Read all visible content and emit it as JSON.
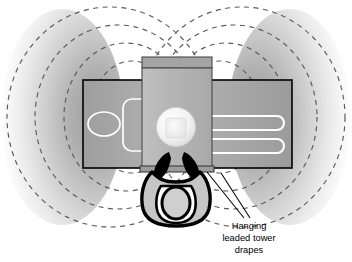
{
  "figure": {
    "type": "schematic-diagram",
    "view": "overhead",
    "background_color": "#ffffff"
  },
  "annotation": {
    "label_lines": [
      "Hanging",
      "leaded tower",
      "drapes"
    ],
    "full_text": "Hanging leaded tower drapes",
    "text_color": "#000000",
    "leader_line_color": "#000000",
    "leader_count": 2
  },
  "scatter_field": {
    "description": "Butterfly-shaped scattered radiation isodose lobes extending left and right of the imaging tower",
    "lobes": [
      "left",
      "right"
    ],
    "contour_style": "dashed",
    "contour_color": "#5a5a5a",
    "contour_count_per_lobe": 4,
    "gradient_inner_color": "#9a9a9a",
    "gradient_outer_color": "#ffffff"
  },
  "equipment": {
    "table": {
      "name": "patient table",
      "fill_color": "#a8a8a8",
      "border_color": "#000000",
      "detail_color": "#ffffff"
    },
    "tower": {
      "name": "imaging tower",
      "fill_color": "#b4b4b4",
      "cap_color": "#a0a0a0",
      "border_color": "#4a4a4a"
    },
    "detector": {
      "name": "circular image detector",
      "fill_color": "#f4f4f4",
      "inner_color": "#e4e4e4"
    },
    "drapes": {
      "name": "hanging leaded tower drapes",
      "fill_color": "#000000",
      "count": 2
    },
    "operator": {
      "name": "operator figure",
      "body_color": "#c4c4c4",
      "outline_color": "#000000",
      "head_color": "#cfcfcf"
    }
  },
  "left_table_markings": {
    "ellipse": "white ellipse outline",
    "rounded_rect": "white rounded rectangle outline"
  },
  "right_table_markings": {
    "rail_count": 2,
    "description": "two white elongated rounded rail outlines"
  }
}
